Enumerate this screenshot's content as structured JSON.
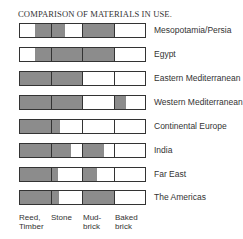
{
  "chart_data": {
    "type": "table",
    "title": "COMPARISON OF MATERIALS IN USE.",
    "columns": [
      "Reed, Timber",
      "Stone",
      "Mud-brick",
      "Baked brick"
    ],
    "column_labels": [
      [
        "Reed,",
        "Timber"
      ],
      [
        "Stone",
        ""
      ],
      [
        "Mud-",
        "brick"
      ],
      [
        "Baked",
        "brick"
      ]
    ],
    "fill_color": "#8c8c8c",
    "note": "Each cell shows shaded portion as [start,end] fraction of the cell width",
    "rows": [
      {
        "region": "Mesopotamia/Persia",
        "fills": [
          [
            0.5,
            1.0
          ],
          [
            0.0,
            0.45
          ],
          [
            0.0,
            1.0
          ],
          null
        ]
      },
      {
        "region": "Egypt",
        "fills": [
          [
            0.5,
            1.0
          ],
          [
            0.0,
            1.0
          ],
          [
            0.0,
            1.0
          ],
          null
        ]
      },
      {
        "region": "Eastern Mediterranean",
        "fills": [
          [
            0.0,
            1.0
          ],
          [
            0.0,
            1.0
          ],
          null,
          null
        ]
      },
      {
        "region": "Western Mediterranean",
        "fills": [
          [
            0.0,
            1.0
          ],
          [
            0.0,
            1.0
          ],
          null,
          [
            0.0,
            0.37
          ]
        ]
      },
      {
        "region": "Continental Europe",
        "fills": [
          [
            0.0,
            1.0
          ],
          [
            0.0,
            0.28
          ],
          null,
          null
        ]
      },
      {
        "region": "India",
        "fills": [
          [
            0.0,
            1.0
          ],
          [
            0.0,
            0.65
          ],
          [
            0.0,
            0.7
          ],
          null
        ]
      },
      {
        "region": "Far East",
        "fills": [
          [
            0.0,
            1.0
          ],
          [
            0.0,
            0.22
          ],
          [
            0.0,
            0.47
          ],
          null
        ]
      },
      {
        "region": "The Americas",
        "fills": [
          [
            0.0,
            1.0
          ],
          [
            0.0,
            0.25
          ],
          [
            0.0,
            1.0
          ],
          null
        ]
      }
    ]
  }
}
